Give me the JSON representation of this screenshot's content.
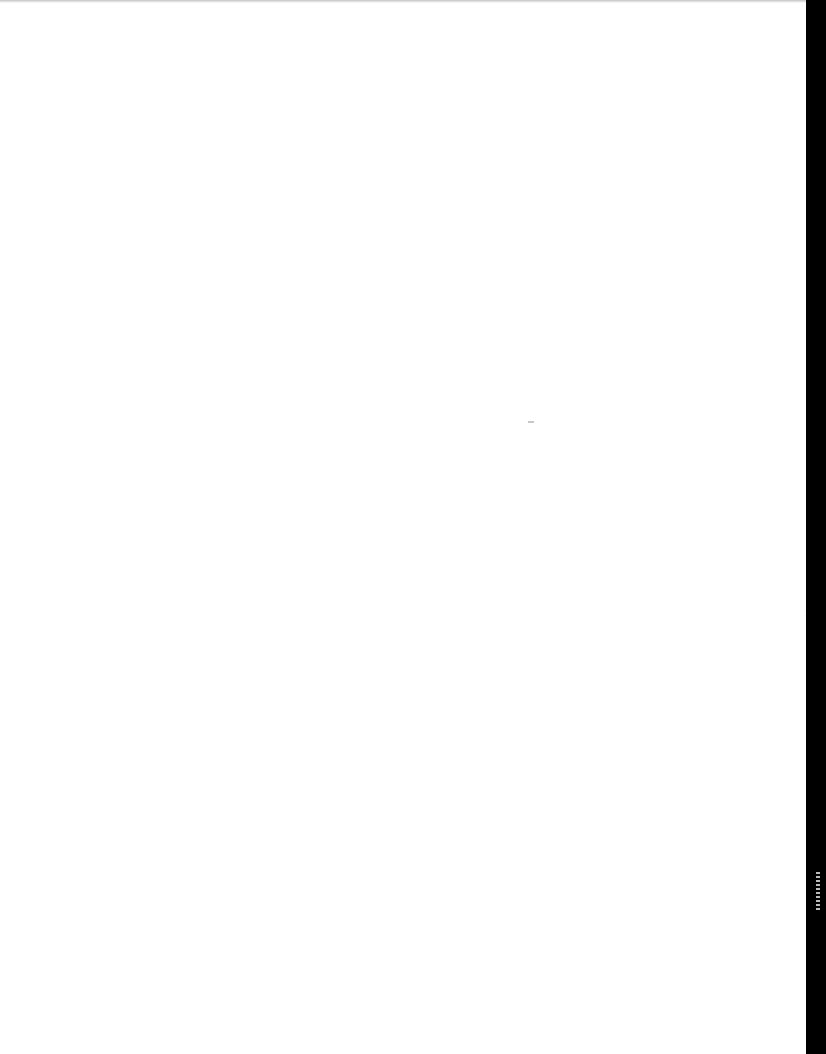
{
  "document": {
    "type": "scanned-page",
    "content": "",
    "background_color": "#ffffff",
    "edge_color": "#000000"
  }
}
